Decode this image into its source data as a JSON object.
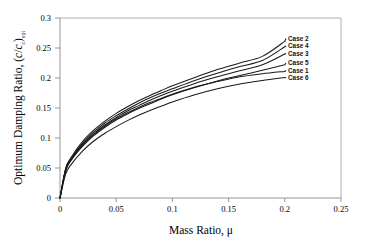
{
  "chart_data": {
    "type": "line",
    "title": "",
    "xlabel": "Mass Ratio, μ",
    "ylabel": "Optimum Damping Ratio, (c/c_c)_opt",
    "xlim": [
      0,
      0.25
    ],
    "ylim": [
      0,
      0.3
    ],
    "xticks": [
      "0",
      "0.05",
      "0.1",
      "0.15",
      "0.2",
      "0.25"
    ],
    "yticks": [
      "0",
      "0.05",
      "0.1",
      "0.15",
      "0.2",
      "0.25",
      "0.3"
    ],
    "grid": false,
    "legend_position": "right-inline-labels",
    "x": [
      0,
      0.005,
      0.01,
      0.02,
      0.03,
      0.04,
      0.05,
      0.06,
      0.07,
      0.08,
      0.09,
      0.1,
      0.12,
      0.14,
      0.16,
      0.18,
      0.2
    ],
    "series": [
      {
        "name": "Case 2",
        "label": "Case 2",
        "end_value": 0.261,
        "values": [
          0,
          0.049,
          0.068,
          0.094,
          0.113,
          0.128,
          0.141,
          0.152,
          0.162,
          0.171,
          0.179,
          0.187,
          0.201,
          0.214,
          0.225,
          0.236,
          0.261
        ]
      },
      {
        "name": "Case 4",
        "label": "Case 4",
        "end_value": 0.252,
        "values": [
          0,
          0.048,
          0.066,
          0.091,
          0.11,
          0.125,
          0.137,
          0.148,
          0.158,
          0.167,
          0.175,
          0.182,
          0.196,
          0.208,
          0.219,
          0.229,
          0.252
        ]
      },
      {
        "name": "Case 3",
        "label": "Case 3",
        "end_value": 0.24,
        "values": [
          0,
          0.047,
          0.065,
          0.089,
          0.107,
          0.122,
          0.134,
          0.145,
          0.154,
          0.163,
          0.171,
          0.178,
          0.191,
          0.202,
          0.212,
          0.222,
          0.24
        ]
      },
      {
        "name": "Case 5",
        "label": "Case 5",
        "end_value": 0.222,
        "values": [
          0,
          0.045,
          0.063,
          0.086,
          0.104,
          0.118,
          0.13,
          0.14,
          0.149,
          0.157,
          0.165,
          0.172,
          0.184,
          0.195,
          0.204,
          0.213,
          0.222
        ]
      },
      {
        "name": "Case 1",
        "label": "Case 1",
        "end_value": 0.211,
        "values": [
          0,
          0.046,
          0.064,
          0.088,
          0.106,
          0.12,
          0.132,
          0.142,
          0.151,
          0.159,
          0.166,
          0.173,
          0.185,
          0.194,
          0.202,
          0.207,
          0.211
        ]
      },
      {
        "name": "Case 6",
        "label": "Case 6",
        "end_value": 0.201,
        "values": [
          0,
          0.04,
          0.056,
          0.078,
          0.095,
          0.108,
          0.119,
          0.129,
          0.138,
          0.146,
          0.153,
          0.16,
          0.172,
          0.182,
          0.19,
          0.196,
          0.201
        ]
      }
    ]
  },
  "axes": {
    "y_title_main": "Optimum Damping Ratio, (",
    "y_title_c1": "c",
    "y_title_slash": "/",
    "y_title_c2": "c",
    "y_title_csub": "c",
    "y_title_close": ")",
    "y_title_opt": "opt",
    "x_title": "Mass Ratio, μ"
  },
  "colors": {
    "curve": "#1a1a1a",
    "axis": "#808080",
    "text": "#000000",
    "background": "#ffffff"
  }
}
